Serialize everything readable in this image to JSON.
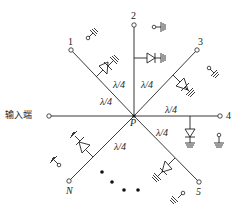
{
  "diagram": {
    "type": "radial power divider with PIN diode switches",
    "center_label": "P",
    "input_label": "输入端",
    "line_length_label": "λ/4",
    "ports": [
      {
        "id": "1",
        "label": "1"
      },
      {
        "id": "2",
        "label": "2"
      },
      {
        "id": "3",
        "label": "3"
      },
      {
        "id": "4",
        "label": "4"
      },
      {
        "id": "5",
        "label": "5"
      },
      {
        "id": "N",
        "label": "N"
      }
    ],
    "segment_labels": [
      "λ/4",
      "λ/4",
      "λ/4",
      "λ/4",
      "λ/4",
      "λ/4"
    ],
    "ellipsis_dots": 4,
    "colors": {
      "line": "#222222",
      "background": "#ffffff"
    }
  }
}
